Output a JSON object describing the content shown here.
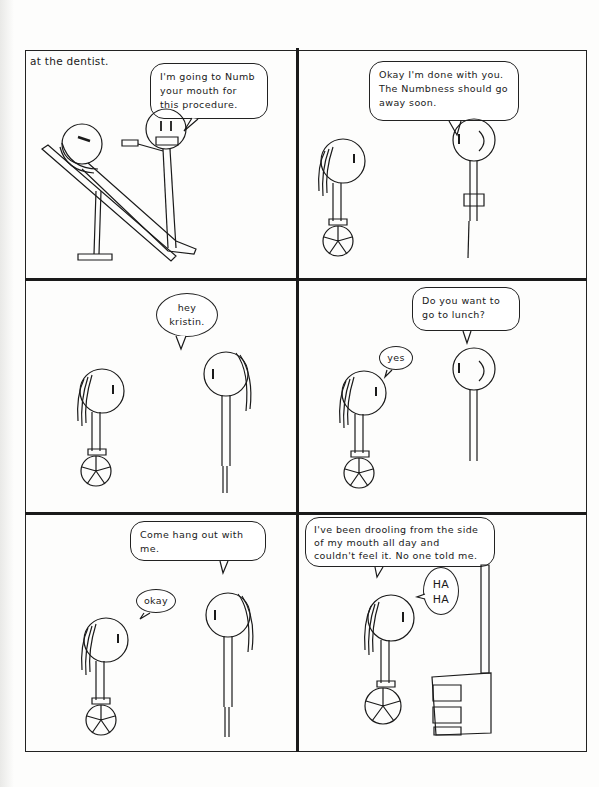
{
  "comic": {
    "caption": "at the dentist.",
    "panels": [
      {
        "id": 1,
        "scene": "dentist numbing patient in reclined chair",
        "bubbles": [
          {
            "speaker": "dentist",
            "text": "I'm going to Numb\nyour mouth for\nthis procedure."
          }
        ]
      },
      {
        "id": 2,
        "scene": "dentist standing, girl in wheelchair",
        "bubbles": [
          {
            "speaker": "dentist",
            "text": "Okay I'm done with you.\nThe Numbness should go\naway soon."
          }
        ]
      },
      {
        "id": 3,
        "scene": "friend greets girl in wheelchair",
        "bubbles": [
          {
            "speaker": "friend",
            "text": "hey\nkristin."
          }
        ]
      },
      {
        "id": 4,
        "scene": "another person asks girl to lunch",
        "bubbles": [
          {
            "speaker": "person",
            "text": "Do you want to\ngo to lunch?"
          },
          {
            "speaker": "kristin",
            "text": "yes"
          }
        ]
      },
      {
        "id": 5,
        "scene": "friend invites girl to hang out",
        "bubbles": [
          {
            "speaker": "friend",
            "text": "Come hang out with\nme."
          },
          {
            "speaker": "kristin",
            "text": "okay"
          }
        ]
      },
      {
        "id": 6,
        "scene": "girl alone next to a dresser, laughing",
        "bubbles": [
          {
            "speaker": "kristin",
            "text": "I've been drooling from the side\nof my mouth all day and\ncouldn't feel it. No one told me."
          },
          {
            "speaker": "kristin",
            "text": "HA\nHA"
          }
        ]
      }
    ]
  },
  "colors": {
    "ink": "#1a1a1a",
    "paper": "#fdfdfc"
  }
}
